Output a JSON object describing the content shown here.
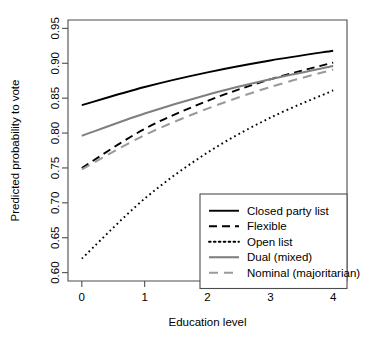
{
  "chart_data": {
    "type": "line",
    "title": "",
    "xlabel": "Education level",
    "ylabel": "Predicted probability to vote",
    "xlim": [
      -0.22,
      4.22
    ],
    "ylim": [
      0.588,
      0.962
    ],
    "xticks": [
      0,
      1,
      2,
      3,
      4
    ],
    "xticklabels": [
      "0",
      "1",
      "2",
      "3",
      "4"
    ],
    "yticks": [
      0.6,
      0.65,
      0.7,
      0.75,
      0.8,
      0.85,
      0.9,
      0.95
    ],
    "yticklabels": [
      "0.60",
      "0.65",
      "0.70",
      "0.75",
      "0.80",
      "0.85",
      "0.90",
      "0.95"
    ],
    "grid": false,
    "legend_position": "bottom-right",
    "x": [
      0,
      1,
      2,
      3,
      4
    ],
    "series": [
      {
        "name": "Closed party list",
        "label": "Closed party list",
        "values": [
          0.84,
          0.866,
          0.887,
          0.904,
          0.918
        ],
        "color": "#000000",
        "linestyle": "solid",
        "dasharray": "",
        "width": 1.9
      },
      {
        "name": "Flexible",
        "label": "Flexible",
        "values": [
          0.75,
          0.806,
          0.846,
          0.877,
          0.901
        ],
        "color": "#000000",
        "linestyle": "dashed",
        "dasharray": "8,5",
        "width": 1.9
      },
      {
        "name": "Open list",
        "label": "Open list",
        "values": [
          0.62,
          0.706,
          0.772,
          0.822,
          0.861
        ],
        "color": "#000000",
        "linestyle": "dotted",
        "dasharray": "1.7,3.2",
        "width": 1.9
      },
      {
        "name": "Dual (mixed)",
        "label": "Dual (mixed)",
        "values": [
          0.796,
          0.828,
          0.855,
          0.877,
          0.896
        ],
        "color": "#7f7f7f",
        "linestyle": "solid",
        "dasharray": "",
        "width": 2.1
      },
      {
        "name": "Nominal (majoritarian)",
        "label": "Nominal (majoritarian)",
        "values": [
          0.748,
          0.797,
          0.835,
          0.866,
          0.891
        ],
        "color": "#9a9a9a",
        "linestyle": "dashed",
        "dasharray": "9,6",
        "width": 2.1
      }
    ]
  },
  "legend": {
    "items": [
      "Closed party list",
      "Flexible",
      "Open list",
      "Dual (mixed)",
      "Nominal (majoritarian)"
    ]
  },
  "colors": {
    "black": "#000000",
    "gray": "#7f7f7f",
    "light_gray": "#9a9a9a",
    "axis": "#4d4d4d",
    "background": "#ffffff"
  }
}
